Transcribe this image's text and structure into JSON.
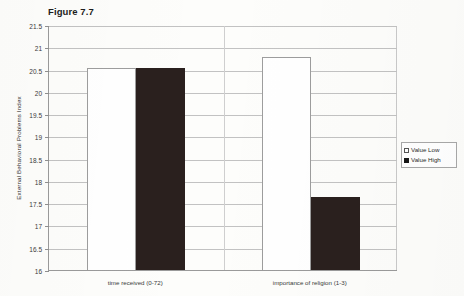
{
  "chart_data": {
    "type": "bar",
    "title": "Figure 7.7",
    "xlabel": "",
    "ylabel": "External Behavioral Problems Index",
    "categories": [
      "time received (0-72)",
      "importance of religion (1-3)"
    ],
    "series": [
      {
        "name": "Value Low",
        "color": "#ffffff",
        "values": [
          20.54,
          20.78
        ]
      },
      {
        "name": "Value High",
        "color": "#2a201e",
        "values": [
          20.54,
          17.63
        ]
      }
    ],
    "ylim": [
      16,
      21.5
    ],
    "ytick_step": 0.5,
    "ytick_labels": [
      "21.5",
      "21",
      "20.5",
      "20",
      "19.5",
      "19",
      "18.5",
      "18",
      "17.5",
      "17",
      "16.5",
      "16"
    ],
    "grid": true,
    "legend_position": "right",
    "legend_entries": [
      "Value Low",
      "Value High"
    ]
  },
  "figure": {
    "background_color": "#fdfdfb",
    "axis_color": "#9a9a9a",
    "grid_color": "#c2c2c2"
  }
}
